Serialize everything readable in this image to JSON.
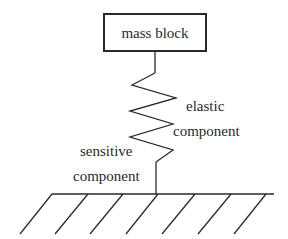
{
  "diagram": {
    "mass_block": {
      "label": "mass block"
    },
    "elastic_component": {
      "line1": "elastic",
      "line2": "component"
    },
    "sensitive_component": {
      "line1": "sensitive",
      "line2": "component"
    },
    "ground": {
      "hatch_count": 7
    },
    "colors": {
      "stroke": "#2a2a2a",
      "background": "#ffffff"
    }
  }
}
